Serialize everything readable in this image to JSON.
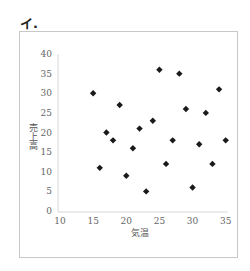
{
  "figure_label": "イ.",
  "chart_data": {
    "type": "scatter",
    "title": "",
    "xlabel": "気温",
    "ylabel": "売上高",
    "xlim": [
      10,
      35
    ],
    "ylim": [
      0,
      40
    ],
    "xticks": [
      10,
      15,
      20,
      25,
      30,
      35
    ],
    "yticks": [
      0,
      5,
      10,
      15,
      20,
      25,
      30,
      35,
      40
    ],
    "grid": false,
    "legend": null,
    "marker": "diamond",
    "marker_color": "#1a1a1a",
    "points": [
      {
        "x": 15,
        "y": 30
      },
      {
        "x": 16,
        "y": 11
      },
      {
        "x": 17,
        "y": 20
      },
      {
        "x": 18,
        "y": 18
      },
      {
        "x": 19,
        "y": 27
      },
      {
        "x": 20,
        "y": 9
      },
      {
        "x": 21,
        "y": 16
      },
      {
        "x": 22,
        "y": 21
      },
      {
        "x": 23,
        "y": 5
      },
      {
        "x": 24,
        "y": 23
      },
      {
        "x": 25,
        "y": 36
      },
      {
        "x": 26,
        "y": 12
      },
      {
        "x": 27,
        "y": 18
      },
      {
        "x": 28,
        "y": 35
      },
      {
        "x": 29,
        "y": 26
      },
      {
        "x": 30,
        "y": 6
      },
      {
        "x": 31,
        "y": 17
      },
      {
        "x": 32,
        "y": 25
      },
      {
        "x": 33,
        "y": 12
      },
      {
        "x": 34,
        "y": 31
      },
      {
        "x": 35,
        "y": 18
      }
    ]
  }
}
